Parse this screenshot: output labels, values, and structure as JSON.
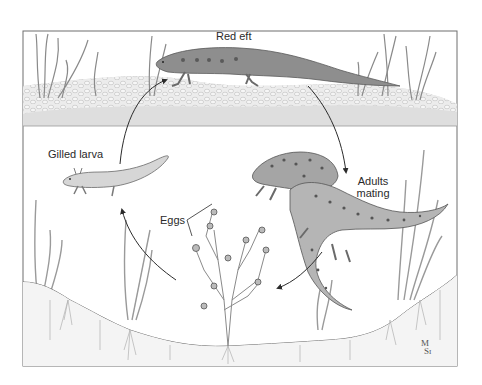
{
  "diagram": {
    "colors": {
      "frame": "#6e6e6e",
      "ink": "#2b2b2b",
      "pebble_fill": "#e9e9e9",
      "pebble_stroke": "#b9b9b9",
      "land_shade": "#dcdcdc",
      "water": "#ffffff",
      "soil_line": "#6a6a6a",
      "plant": "#9a9a9a",
      "newt_dark": "#8a8a8a",
      "newt_light": "#bdbdbd",
      "larva": "#d4d4d4",
      "spot": "#555555"
    },
    "stages": [
      {
        "id": "red-eft",
        "label": "Red eft"
      },
      {
        "id": "adults-mating",
        "label_line1": "Adults",
        "label_line2": "mating"
      },
      {
        "id": "eggs",
        "label": "Eggs"
      },
      {
        "id": "gilled-larva",
        "label": "Gilled larva"
      }
    ],
    "cycle_arrows": [
      {
        "from": "gilled-larva",
        "to": "red-eft"
      },
      {
        "from": "red-eft",
        "to": "adults-mating"
      },
      {
        "from": "adults-mating",
        "to": "eggs"
      },
      {
        "from": "eggs",
        "to": "gilled-larva"
      }
    ],
    "signature": {
      "line1": "M",
      "line2": "S",
      "line3": "I"
    }
  }
}
